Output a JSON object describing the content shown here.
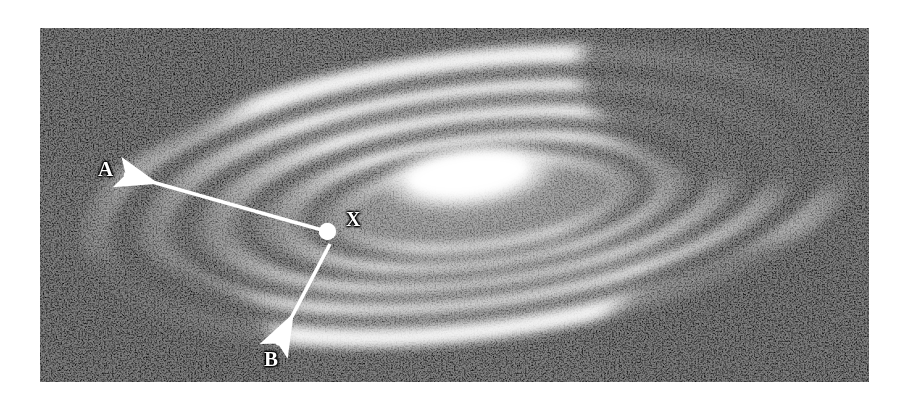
{
  "figure": {
    "kind": "astronomical-photograph",
    "caption": "",
    "frame": {
      "left": 40,
      "top": 28,
      "width": 829,
      "height": 354,
      "background_color": "#050505",
      "page_background_color": "#ffffff"
    },
    "style": {
      "reproduction": "coarse halftone / dithered black-and-white print",
      "ink_color": "#ffffff",
      "paper_color": "#ffffff"
    }
  },
  "annotations": {
    "marker": {
      "name": "X",
      "label": "X",
      "meaning": "position of the Sun in the galactic disk",
      "dot_color": "#ffffff",
      "dot_diameter_px": 17,
      "center": {
        "x": 328,
        "y": 232
      }
    },
    "arrows": [
      {
        "id": "arrow-a",
        "label": "A",
        "from": {
          "x": 322,
          "y": 230
        },
        "to": {
          "x": 120,
          "y": 173
        },
        "direction": "up-left toward the outer spiral arm",
        "color": "#ffffff",
        "label_position": {
          "x": 101,
          "y": 162
        }
      },
      {
        "id": "arrow-b",
        "label": "B",
        "from": {
          "x": 330,
          "y": 244
        },
        "to": {
          "x": 276,
          "y": 345
        },
        "direction": "down-left across the disk",
        "color": "#ffffff",
        "label_position": {
          "x": 267,
          "y": 352
        }
      }
    ]
  },
  "galaxy_structure": {
    "core": {
      "label": "bright nucleus",
      "center": {
        "x": 470,
        "y": 176
      },
      "rx": 95,
      "ry": 36,
      "rotation_deg": -7,
      "brightness": "saturated white"
    },
    "arms": [
      {
        "id": "arm-outer-upper",
        "brightness": "bright"
      },
      {
        "id": "arm-upper-inner",
        "brightness": "bright"
      },
      {
        "id": "arm-lower-inner",
        "brightness": "medium"
      },
      {
        "id": "arm-lower-outer",
        "brightness": "medium"
      },
      {
        "id": "arm-faint-lower-left",
        "brightness": "faint"
      }
    ],
    "dust_lanes": [
      {
        "id": "lane-upper",
        "brightness": "dark"
      },
      {
        "id": "lane-lower",
        "brightness": "dark"
      }
    ]
  }
}
